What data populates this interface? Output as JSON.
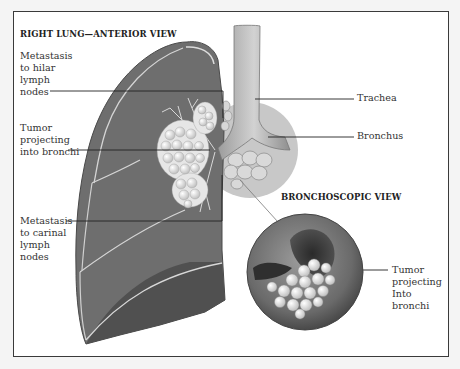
{
  "figure": {
    "main_title": "RIGHT LUNG—ANTERIOR VIEW",
    "inset_title": "BRONCHOSCOPIC VIEW",
    "labels": {
      "hilar": "Metastasis\nto hilar\nlymph\nnodes",
      "tumor": "Tumor\nprojecting\ninto bronchi",
      "carinal": "Metastasis\nto carinal\nlymph\nnodes",
      "trachea": "Trachea",
      "bronchus": "Bronchus",
      "inset_tumor": "Tumor\nprojecting\nInto\nbronchi"
    },
    "colors": {
      "lung": "#6e6e6e",
      "lung_dark": "#4e4e4e",
      "tumor": "#e8e8e8",
      "bubble": "#c9c9c9",
      "frame": "#3a3a3a",
      "leader_line": "#222222"
    }
  }
}
